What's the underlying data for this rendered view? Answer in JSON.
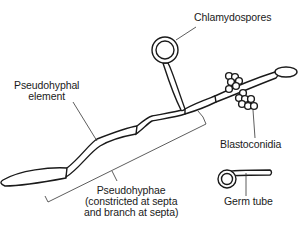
{
  "diagram": {
    "labels": {
      "chlamydospores": "Chlamydospores",
      "pseudohyphal_element_line1": "Pseudohyphal",
      "pseudohyphal_element_line2": "element",
      "blastoconidia": "Blastoconidia",
      "pseudohyphae_line1": "Pseudohyphae",
      "pseudohyphae_line2": "(constricted at septa",
      "pseudohyphae_line3": "and branch at septa)",
      "germ_tube": "Germ tube"
    },
    "colors": {
      "line": "#1a1a1a",
      "background": "#ffffff"
    }
  }
}
